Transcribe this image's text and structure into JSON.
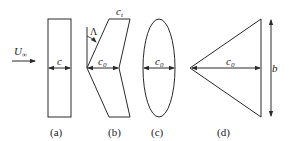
{
  "diagram": {
    "freestream_label": "U",
    "freestream_subscript": "∞",
    "shapes": [
      {
        "id": "a",
        "caption": "(a)",
        "type": "rectangle",
        "chord_label": "c",
        "chord_subscript": ""
      },
      {
        "id": "b",
        "caption": "(b)",
        "type": "swept",
        "chord_label": "c",
        "chord_subscript": "0",
        "tip_label": "c",
        "tip_subscript": "t",
        "sweep_label": "Λ"
      },
      {
        "id": "c",
        "caption": "(c)",
        "type": "ellipse",
        "chord_label": "c",
        "chord_subscript": "0"
      },
      {
        "id": "d",
        "caption": "(d)",
        "type": "delta",
        "chord_label": "c",
        "chord_subscript": "0",
        "span_label": "b"
      }
    ],
    "colors": {
      "line": "#2a2a2a",
      "text": "#1a1a1a",
      "background": "#ffffff"
    }
  }
}
